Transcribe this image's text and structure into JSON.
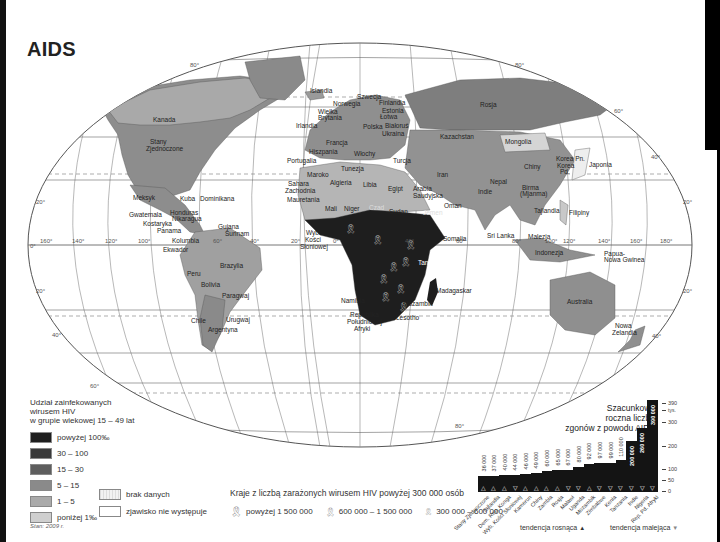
{
  "title": "AIDS",
  "map": {
    "degree_labels": {
      "lat_left": [
        "20°",
        "0°",
        "20°",
        "40°"
      ],
      "lon_equator": [
        "160°",
        "140°",
        "120°",
        "100°",
        "60°",
        "40°",
        "20°",
        "0°",
        "20°",
        "40°",
        "60°",
        "80°",
        "100°",
        "120°",
        "140°",
        "160°",
        "180°"
      ],
      "lat_right": [
        "60°",
        "40°",
        "20°",
        "20°",
        "40°"
      ],
      "top": [
        "80°",
        "80°"
      ],
      "bottom": [
        "60°",
        "80°"
      ]
    },
    "countries": [
      {
        "name": "Kanada",
        "x": 153,
        "y": 122
      },
      {
        "name": "Stany Zjednoczone",
        "x": 158,
        "y": 144
      },
      {
        "name": "Meksyk",
        "x": 138,
        "y": 198
      },
      {
        "name": "Kuba",
        "x": 184,
        "y": 200
      },
      {
        "name": "Dominikana",
        "x": 213,
        "y": 201
      },
      {
        "name": "Honduras",
        "x": 180,
        "y": 215
      },
      {
        "name": "Gwatemala",
        "x": 137,
        "y": 217
      },
      {
        "name": "Nikaragua",
        "x": 184,
        "y": 221
      },
      {
        "name": "Kostaryka",
        "x": 143,
        "y": 226
      },
      {
        "name": "Panama",
        "x": 157,
        "y": 233
      },
      {
        "name": "Gujana",
        "x": 218,
        "y": 227
      },
      {
        "name": "Surinam",
        "x": 225,
        "y": 234
      },
      {
        "name": "Kolumbia",
        "x": 176,
        "y": 241
      },
      {
        "name": "Ekwador",
        "x": 163,
        "y": 250
      },
      {
        "name": "Brazylia",
        "x": 225,
        "y": 266
      },
      {
        "name": "Peru",
        "x": 191,
        "y": 274
      },
      {
        "name": "Bolivia",
        "x": 207,
        "y": 285
      },
      {
        "name": "Paragwaj",
        "x": 227,
        "y": 297
      },
      {
        "name": "Chile",
        "x": 192,
        "y": 321
      },
      {
        "name": "Urugwaj",
        "x": 233,
        "y": 321
      },
      {
        "name": "Argentyna",
        "x": 214,
        "y": 331
      },
      {
        "name": "Islandia",
        "x": 323,
        "y": 91
      },
      {
        "name": "Norwegia",
        "x": 339,
        "y": 104
      },
      {
        "name": "Szwecja",
        "x": 370,
        "y": 97
      },
      {
        "name": "Finlandia",
        "x": 392,
        "y": 103
      },
      {
        "name": "Estonia",
        "x": 392,
        "y": 111
      },
      {
        "name": "Łotwa",
        "x": 388,
        "y": 117
      },
      {
        "name": "Wielka Brytania",
        "x": 324,
        "y": 115
      },
      {
        "name": "Irlandia",
        "x": 307,
        "y": 126
      },
      {
        "name": "Polska",
        "x": 375,
        "y": 127
      },
      {
        "name": "Białoruś",
        "x": 400,
        "y": 126
      },
      {
        "name": "Ukraina",
        "x": 396,
        "y": 134
      },
      {
        "name": "Francja",
        "x": 338,
        "y": 143
      },
      {
        "name": "Hiszpania",
        "x": 311,
        "y": 152
      },
      {
        "name": "Włochy",
        "x": 353,
        "y": 154
      },
      {
        "name": "Portugalia",
        "x": 288,
        "y": 162
      },
      {
        "name": "Turcja",
        "x": 395,
        "y": 161
      },
      {
        "name": "Rosja",
        "x": 486,
        "y": 105
      },
      {
        "name": "Kazachstan",
        "x": 439,
        "y": 137
      },
      {
        "name": "Mongolia",
        "x": 523,
        "y": 142
      },
      {
        "name": "Chiny",
        "x": 527,
        "y": 166
      },
      {
        "name": "Korea Pn.",
        "x": 562,
        "y": 159
      },
      {
        "name": "Korea Pd.",
        "x": 560,
        "y": 171
      },
      {
        "name": "Japonia",
        "x": 588,
        "y": 164
      },
      {
        "name": "Tunezja",
        "x": 343,
        "y": 169
      },
      {
        "name": "Maroko",
        "x": 307,
        "y": 175
      },
      {
        "name": "Iran",
        "x": 440,
        "y": 175
      },
      {
        "name": "Algieria",
        "x": 333,
        "y": 183
      },
      {
        "name": "Libia",
        "x": 367,
        "y": 185
      },
      {
        "name": "Egipt",
        "x": 390,
        "y": 189
      },
      {
        "name": "Sahara Zachodnia",
        "x": 292,
        "y": 186
      },
      {
        "name": "Mauretania",
        "x": 297,
        "y": 200
      },
      {
        "name": "Arabia Saudyjska",
        "x": 418,
        "y": 193
      },
      {
        "name": "Nepal",
        "x": 491,
        "y": 182
      },
      {
        "name": "Indie",
        "x": 484,
        "y": 192
      },
      {
        "name": "Birma (Mjanma)",
        "x": 527,
        "y": 193
      },
      {
        "name": "Oman",
        "x": 446,
        "y": 207
      },
      {
        "name": "Mali",
        "x": 329,
        "y": 209
      },
      {
        "name": "Niger",
        "x": 350,
        "y": 209
      },
      {
        "name": "Czad",
        "x": 378,
        "y": 208
      },
      {
        "name": "Sudan",
        "x": 395,
        "y": 212
      },
      {
        "name": "Jemen",
        "x": 430,
        "y": 213
      },
      {
        "name": "Tajlandia",
        "x": 532,
        "y": 211
      },
      {
        "name": "Filipiny",
        "x": 569,
        "y": 213
      },
      {
        "name": "Somalia",
        "x": 446,
        "y": 239
      },
      {
        "name": "Wybrzeże Kości Słoniowej",
        "x": 305,
        "y": 233
      },
      {
        "name": "Sri Lanka",
        "x": 496,
        "y": 236
      },
      {
        "name": "Malezja",
        "x": 534,
        "y": 237
      },
      {
        "name": "Indonezja",
        "x": 543,
        "y": 253
      },
      {
        "name": "Papua-Nowa Gwinea",
        "x": 615,
        "y": 257
      },
      {
        "name": "Tanzania",
        "x": 432,
        "y": 263
      },
      {
        "name": "Madagaskar",
        "x": 443,
        "y": 290
      },
      {
        "name": "Namibia",
        "x": 344,
        "y": 300
      },
      {
        "name": "Mozambik",
        "x": 414,
        "y": 304
      },
      {
        "name": "Republika Południowej Afryki",
        "x": 355,
        "y": 318
      },
      {
        "name": "Lesotho",
        "x": 398,
        "y": 318
      },
      {
        "name": "Australia",
        "x": 581,
        "y": 303
      },
      {
        "name": "Nowa Zelandia",
        "x": 625,
        "y": 330
      }
    ]
  },
  "legend": {
    "title_lines": [
      "Udział zainfekowanych",
      "wirusem HIV",
      "w grupie wiekowej 15 – 49 lat"
    ],
    "classes": [
      {
        "label": "powyżej 100‰",
        "color": "#1e1e1e"
      },
      {
        "label": "30 – 100",
        "color": "#3a3a3a"
      },
      {
        "label": "15 – 30",
        "color": "#5e5e5e"
      },
      {
        "label": "5 – 15",
        "color": "#8a8a8a"
      },
      {
        "label": "1 – 5",
        "color": "#aaaaaa"
      },
      {
        "label": "poniżej 1‰",
        "color": "#cfcfcf"
      }
    ],
    "extra": [
      {
        "label": "brak danych"
      },
      {
        "label": "zjawisko nie występuje"
      }
    ],
    "ribbons": {
      "title": "Kraje z liczbą zarażonych wirusem HIV powyżej 300 000 osób",
      "items": [
        {
          "label": "powyżej 1 500 000"
        },
        {
          "label": "600 000 – 1 500 000"
        },
        {
          "label": "300 000 – 600 000"
        }
      ]
    },
    "stan": "Stan: 2009 r."
  },
  "chart_data": {
    "type": "bar",
    "title": "Szacunkowa roczna liczba zgonów z powodu AIDS",
    "title_lines": [
      "Szacunkowa",
      "roczna liczba",
      "zgonów z powodu AIDS"
    ],
    "ylabel": "tys.",
    "yticks": [
      "390",
      "300",
      "200",
      "100",
      "50",
      "0"
    ],
    "ylim": [
      0,
      390
    ],
    "categories": [
      "Stany Zjednoczone",
      "Tajlandia",
      "Dem. Rep. Konga",
      "Wyb. Kości Słoniowej",
      "Kamerun",
      "Chiny",
      "Zambia",
      "Rosja",
      "Malawi",
      "Uganda",
      "Mozambik",
      "Zimbabwe",
      "Kenia",
      "Tanzania",
      "Indie",
      "Nigeria",
      "Rep. Pd. Afryki"
    ],
    "values": [
      36000,
      37000,
      40000,
      44000,
      46000,
      49000,
      60000,
      65000,
      67000,
      80000,
      92000,
      97000,
      99000,
      110000,
      200000,
      260000,
      390000
    ],
    "value_labels": [
      "36 000",
      "37 000",
      "40 000",
      "44 000",
      "46 000",
      "49 000",
      "60 000",
      "65 000",
      "67 000",
      "80 000",
      "92 000",
      "97 000",
      "99 000",
      "110 000",
      "200 000",
      "260 000",
      "390 000"
    ],
    "trend": [
      "up",
      "up",
      "up",
      "down",
      "up",
      "up",
      "up",
      "up",
      "down",
      "down",
      "up",
      "down",
      "down",
      "down",
      "down",
      "down",
      "down"
    ],
    "legend": [
      {
        "label": "tendencja rosnąca",
        "symbol": "▲"
      },
      {
        "label": "tendencja malejąca",
        "symbol": "▼"
      }
    ]
  }
}
